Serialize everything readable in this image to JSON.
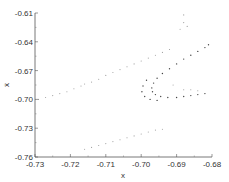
{
  "chart_data": {
    "type": "scatter",
    "title": "",
    "xlabel": "x",
    "ylabel": "ẋ",
    "xlim": [
      -0.73,
      -0.68
    ],
    "ylim": [
      -0.76,
      -0.61
    ],
    "xticks": [
      "-0.73",
      "-0.72",
      "-0.71",
      "-0.70",
      "-0.69",
      "-0.68"
    ],
    "yticks": [
      "-0.61",
      "-0.64",
      "-0.67",
      "-0.70",
      "-0.73",
      "-0.76"
    ],
    "grid": false,
    "legend": null,
    "point_color": "#555555",
    "series": [
      {
        "name": "upper-left diagonal band",
        "points": [
          [
            -0.729,
            -0.7
          ],
          [
            -0.727,
            -0.698
          ],
          [
            -0.725,
            -0.696
          ],
          [
            -0.723,
            -0.694
          ],
          [
            -0.721,
            -0.692
          ],
          [
            -0.719,
            -0.689
          ],
          [
            -0.717,
            -0.686
          ],
          [
            -0.716,
            -0.684
          ],
          [
            -0.714,
            -0.682
          ],
          [
            -0.712,
            -0.679
          ],
          [
            -0.71,
            -0.675
          ],
          [
            -0.708,
            -0.672
          ],
          [
            -0.706,
            -0.669
          ],
          [
            -0.704,
            -0.666
          ],
          [
            -0.702,
            -0.663
          ],
          [
            -0.7,
            -0.66
          ],
          [
            -0.698,
            -0.657
          ],
          [
            -0.696,
            -0.654
          ],
          [
            -0.694,
            -0.651
          ],
          [
            -0.692,
            -0.648
          ]
        ]
      },
      {
        "name": "lower-left diagonal band",
        "points": [
          [
            -0.716,
            -0.752
          ],
          [
            -0.714,
            -0.75
          ],
          [
            -0.712,
            -0.748
          ],
          [
            -0.71,
            -0.746
          ],
          [
            -0.708,
            -0.744
          ],
          [
            -0.706,
            -0.742
          ],
          [
            -0.704,
            -0.74
          ],
          [
            -0.702,
            -0.738
          ],
          [
            -0.7,
            -0.736
          ],
          [
            -0.698,
            -0.734
          ],
          [
            -0.696,
            -0.732
          ],
          [
            -0.694,
            -0.731
          ]
        ]
      },
      {
        "name": "attractor curve",
        "points": [
          [
            -0.681,
            -0.643
          ],
          [
            -0.682,
            -0.646
          ],
          [
            -0.684,
            -0.65
          ],
          [
            -0.686,
            -0.654
          ],
          [
            -0.688,
            -0.658
          ],
          [
            -0.69,
            -0.663
          ],
          [
            -0.692,
            -0.668
          ],
          [
            -0.694,
            -0.673
          ],
          [
            -0.6955,
            -0.678
          ],
          [
            -0.6965,
            -0.683
          ],
          [
            -0.697,
            -0.688
          ],
          [
            -0.6968,
            -0.692
          ],
          [
            -0.696,
            -0.695
          ],
          [
            -0.6945,
            -0.697
          ],
          [
            -0.6925,
            -0.698
          ],
          [
            -0.69,
            -0.698
          ],
          [
            -0.688,
            -0.697
          ],
          [
            -0.686,
            -0.696
          ],
          [
            -0.684,
            -0.695
          ],
          [
            -0.682,
            -0.694
          ],
          [
            -0.6985,
            -0.68
          ],
          [
            -0.6995,
            -0.686
          ],
          [
            -0.6998,
            -0.692
          ],
          [
            -0.699,
            -0.697
          ],
          [
            -0.6975,
            -0.7
          ],
          [
            -0.6955,
            -0.701
          ]
        ]
      },
      {
        "name": "scattered points",
        "points": [
          [
            -0.688,
            -0.612
          ],
          [
            -0.688,
            -0.62
          ],
          [
            -0.687,
            -0.624
          ],
          [
            -0.689,
            -0.627
          ],
          [
            -0.691,
            -0.685
          ],
          [
            -0.688,
            -0.69
          ],
          [
            -0.686,
            -0.69
          ],
          [
            -0.684,
            -0.691
          ]
        ]
      }
    ]
  }
}
